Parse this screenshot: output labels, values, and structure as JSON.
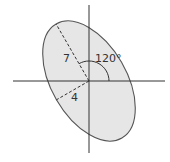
{
  "diagram": {
    "type": "rotated-ellipse",
    "semi_major_label": "7",
    "semi_minor_label": "4",
    "semi_major": 7,
    "semi_minor": 4,
    "rotation_deg": 120,
    "angle_label": "120°",
    "colors": {
      "fill": "#e6e6e6",
      "stroke": "#555555",
      "axis": "#333333",
      "dash": "#333333",
      "text": "#333333"
    }
  }
}
